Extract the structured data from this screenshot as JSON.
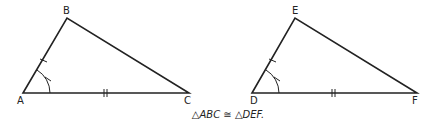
{
  "figure": {
    "triangle1": {
      "vertices": {
        "A": "A",
        "B": "B",
        "C": "C"
      }
    },
    "triangle2": {
      "vertices": {
        "D": "D",
        "E": "E",
        "F": "F"
      }
    },
    "caption": "△ABC ≅ △DEF."
  },
  "colors": {
    "stroke": "#222222",
    "background": "#ffffff"
  }
}
